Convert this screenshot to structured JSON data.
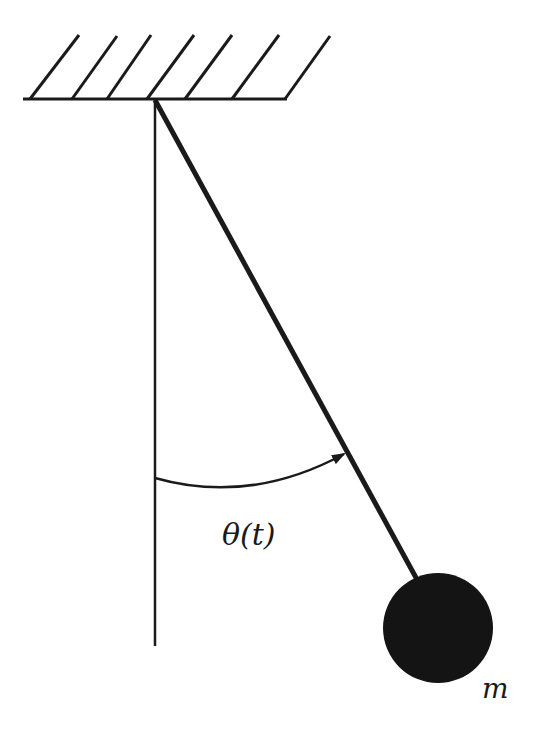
{
  "diagram": {
    "type": "simple pendulum",
    "labels": {
      "angle": "θ(t)",
      "mass": "m"
    },
    "colors": {
      "stroke": "#1a1a1a",
      "background": "#ffffff"
    },
    "elements": [
      "ceiling with hatching",
      "vertical reference line",
      "pendulum rod",
      "angle arc with arrow",
      "bob mass"
    ]
  }
}
